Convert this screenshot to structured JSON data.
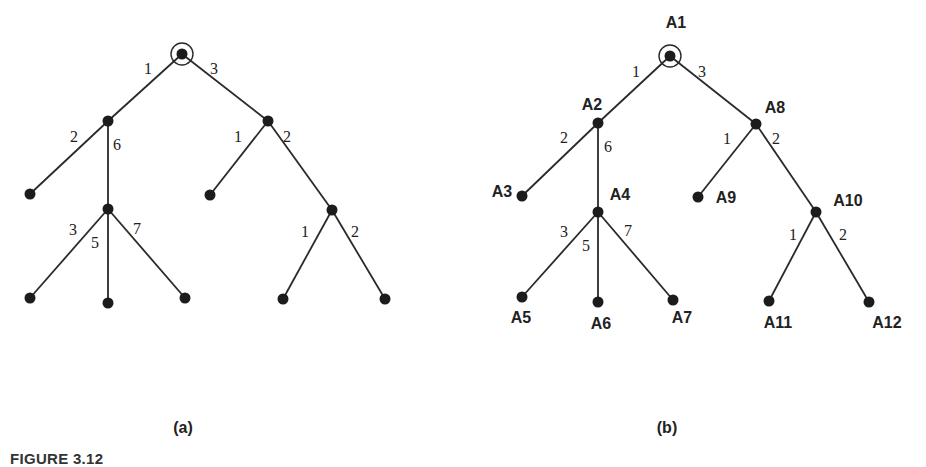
{
  "figure": {
    "caption": "FIGURE 3.12",
    "panels": [
      {
        "id": "a",
        "label": "(a)",
        "label_pos": [
          183,
          433
        ],
        "root": "r",
        "nodes": [
          {
            "id": "r",
            "x": 182,
            "y": 54,
            "label": ""
          },
          {
            "id": "n2",
            "x": 108,
            "y": 121,
            "label": ""
          },
          {
            "id": "n3",
            "x": 30,
            "y": 194,
            "label": ""
          },
          {
            "id": "n4",
            "x": 108,
            "y": 209,
            "label": ""
          },
          {
            "id": "n5",
            "x": 30,
            "y": 298,
            "label": ""
          },
          {
            "id": "n6",
            "x": 108,
            "y": 303,
            "label": ""
          },
          {
            "id": "n7",
            "x": 185,
            "y": 298,
            "label": ""
          },
          {
            "id": "n8",
            "x": 268,
            "y": 121,
            "label": ""
          },
          {
            "id": "n9",
            "x": 210,
            "y": 195,
            "label": ""
          },
          {
            "id": "n10",
            "x": 332,
            "y": 210,
            "label": ""
          },
          {
            "id": "n11",
            "x": 283,
            "y": 299,
            "label": ""
          },
          {
            "id": "n12",
            "x": 385,
            "y": 299,
            "label": ""
          }
        ],
        "edges": [
          {
            "from": "r",
            "to": "n2",
            "weight": "1",
            "wpos": [
              148,
              74
            ]
          },
          {
            "from": "r",
            "to": "n8",
            "weight": "3",
            "wpos": [
              214,
              74
            ]
          },
          {
            "from": "n2",
            "to": "n3",
            "weight": "2",
            "wpos": [
              74,
              142
            ]
          },
          {
            "from": "n2",
            "to": "n4",
            "weight": "6",
            "wpos": [
              117,
              150
            ]
          },
          {
            "from": "n4",
            "to": "n5",
            "weight": "3",
            "wpos": [
              73,
              235
            ]
          },
          {
            "from": "n4",
            "to": "n6",
            "weight": "5",
            "wpos": [
              95,
              248
            ]
          },
          {
            "from": "n4",
            "to": "n7",
            "weight": "7",
            "wpos": [
              137,
              234
            ]
          },
          {
            "from": "n8",
            "to": "n9",
            "weight": "1",
            "wpos": [
              238,
              142
            ]
          },
          {
            "from": "n8",
            "to": "n10",
            "weight": "2",
            "wpos": [
              287,
              142
            ]
          },
          {
            "from": "n10",
            "to": "n11",
            "weight": "1",
            "wpos": [
              305,
              237
            ]
          },
          {
            "from": "n10",
            "to": "n12",
            "weight": "2",
            "wpos": [
              355,
              237
            ]
          }
        ]
      },
      {
        "id": "b",
        "label": "(b)",
        "label_pos": [
          667,
          433
        ],
        "root": "A1",
        "nodes": [
          {
            "id": "A1",
            "x": 670,
            "y": 56,
            "label": "A1",
            "lpos": [
              676,
              28
            ]
          },
          {
            "id": "A2",
            "x": 598,
            "y": 123,
            "label": "A2",
            "lpos": [
              592,
              110
            ]
          },
          {
            "id": "A3",
            "x": 522,
            "y": 196,
            "label": "A3",
            "lpos": [
              502,
              197
            ]
          },
          {
            "id": "A4",
            "x": 598,
            "y": 212,
            "label": "A4",
            "lpos": [
              620,
              200
            ]
          },
          {
            "id": "A5",
            "x": 522,
            "y": 297,
            "label": "A5",
            "lpos": [
              521,
              323
            ]
          },
          {
            "id": "A6",
            "x": 598,
            "y": 302,
            "label": "A6",
            "lpos": [
              601,
              329
            ]
          },
          {
            "id": "A7",
            "x": 673,
            "y": 300,
            "label": "A7",
            "lpos": [
              682,
              323
            ]
          },
          {
            "id": "A8",
            "x": 756,
            "y": 124,
            "label": "A8",
            "lpos": [
              775,
              113
            ]
          },
          {
            "id": "A9",
            "x": 698,
            "y": 197,
            "label": "A9",
            "lpos": [
              726,
              203
            ]
          },
          {
            "id": "A10",
            "x": 816,
            "y": 212,
            "label": "A10",
            "lpos": [
              848,
              206
            ]
          },
          {
            "id": "A11",
            "x": 769,
            "y": 301,
            "label": "A11",
            "lpos": [
              778,
              328
            ]
          },
          {
            "id": "A12",
            "x": 869,
            "y": 302,
            "label": "A12",
            "lpos": [
              887,
              328
            ]
          }
        ],
        "edges": [
          {
            "from": "A1",
            "to": "A2",
            "weight": "1",
            "wpos": [
              636,
              77
            ]
          },
          {
            "from": "A1",
            "to": "A8",
            "weight": "3",
            "wpos": [
              702,
              77
            ]
          },
          {
            "from": "A2",
            "to": "A3",
            "weight": "2",
            "wpos": [
              564,
              143
            ]
          },
          {
            "from": "A2",
            "to": "A4",
            "weight": "6",
            "wpos": [
              608,
              152
            ]
          },
          {
            "from": "A4",
            "to": "A5",
            "weight": "3",
            "wpos": [
              564,
              237
            ]
          },
          {
            "from": "A4",
            "to": "A6",
            "weight": "5",
            "wpos": [
              586,
              251
            ]
          },
          {
            "from": "A4",
            "to": "A7",
            "weight": "7",
            "wpos": [
              628,
              236
            ]
          },
          {
            "from": "A8",
            "to": "A9",
            "weight": "1",
            "wpos": [
              727,
              144
            ]
          },
          {
            "from": "A8",
            "to": "A10",
            "weight": "2",
            "wpos": [
              776,
              144
            ]
          },
          {
            "from": "A10",
            "to": "A11",
            "weight": "1",
            "wpos": [
              793,
              240
            ]
          },
          {
            "from": "A10",
            "to": "A12",
            "weight": "2",
            "wpos": [
              843,
              240
            ]
          }
        ]
      }
    ]
  }
}
